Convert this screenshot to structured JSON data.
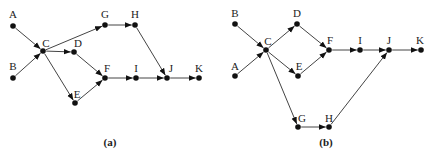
{
  "diagrams": [
    {
      "id": "a",
      "caption": "(a)",
      "caption_pos": [
        110,
        146
      ],
      "nodes": [
        {
          "id": "A",
          "x": 13,
          "y": 26,
          "lx": 13,
          "ly": 18
        },
        {
          "id": "B",
          "x": 13,
          "y": 78,
          "lx": 13,
          "ly": 70
        },
        {
          "id": "C",
          "x": 43,
          "y": 51,
          "lx": 46,
          "ly": 47
        },
        {
          "id": "D",
          "x": 74,
          "y": 52,
          "lx": 78,
          "ly": 47
        },
        {
          "id": "G",
          "x": 105,
          "y": 25,
          "lx": 105,
          "ly": 18
        },
        {
          "id": "H",
          "x": 135,
          "y": 25,
          "lx": 135,
          "ly": 18
        },
        {
          "id": "E",
          "x": 75,
          "y": 103,
          "lx": 77,
          "ly": 98
        },
        {
          "id": "F",
          "x": 105,
          "y": 78,
          "lx": 107,
          "ly": 72
        },
        {
          "id": "I",
          "x": 136,
          "y": 78,
          "lx": 136,
          "ly": 72
        },
        {
          "id": "J",
          "x": 167,
          "y": 78,
          "lx": 171,
          "ly": 72
        },
        {
          "id": "K",
          "x": 199,
          "y": 78,
          "lx": 199,
          "ly": 72
        }
      ],
      "edges": [
        [
          "A",
          "C"
        ],
        [
          "B",
          "C"
        ],
        [
          "C",
          "G"
        ],
        [
          "C",
          "D"
        ],
        [
          "C",
          "E"
        ],
        [
          "D",
          "F"
        ],
        [
          "E",
          "F"
        ],
        [
          "G",
          "H"
        ],
        [
          "H",
          "J"
        ],
        [
          "F",
          "I"
        ],
        [
          "I",
          "J"
        ],
        [
          "J",
          "K"
        ]
      ]
    },
    {
      "id": "b",
      "caption": "(b)",
      "caption_pos": [
        326,
        146
      ],
      "nodes": [
        {
          "id": "B",
          "x": 235,
          "y": 24,
          "lx": 235,
          "ly": 17
        },
        {
          "id": "A",
          "x": 235,
          "y": 76,
          "lx": 235,
          "ly": 70
        },
        {
          "id": "C",
          "x": 266,
          "y": 50,
          "lx": 268,
          "ly": 45
        },
        {
          "id": "D",
          "x": 297,
          "y": 24,
          "lx": 297,
          "ly": 17
        },
        {
          "id": "E",
          "x": 298,
          "y": 76,
          "lx": 299,
          "ly": 70
        },
        {
          "id": "F",
          "x": 329,
          "y": 50,
          "lx": 330,
          "ly": 44
        },
        {
          "id": "I",
          "x": 360,
          "y": 50,
          "lx": 360,
          "ly": 44
        },
        {
          "id": "J",
          "x": 389,
          "y": 50,
          "lx": 389,
          "ly": 44
        },
        {
          "id": "K",
          "x": 421,
          "y": 50,
          "lx": 420,
          "ly": 44
        },
        {
          "id": "G",
          "x": 298,
          "y": 127,
          "lx": 302,
          "ly": 122
        },
        {
          "id": "H",
          "x": 329,
          "y": 127,
          "lx": 329,
          "ly": 122
        }
      ],
      "edges": [
        [
          "B",
          "C"
        ],
        [
          "A",
          "C"
        ],
        [
          "C",
          "D"
        ],
        [
          "C",
          "E"
        ],
        [
          "C",
          "G"
        ],
        [
          "D",
          "F"
        ],
        [
          "E",
          "F"
        ],
        [
          "F",
          "I"
        ],
        [
          "I",
          "J"
        ],
        [
          "J",
          "K"
        ],
        [
          "G",
          "H"
        ],
        [
          "H",
          "J"
        ]
      ]
    }
  ],
  "style": {
    "node_color": "#111111",
    "edge_color": "#444444",
    "background": "#ffffff"
  }
}
